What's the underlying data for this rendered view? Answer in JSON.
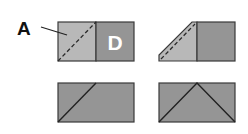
{
  "diagram": {
    "labels": {
      "pointer": "A",
      "panel": "D"
    },
    "colors": {
      "background": "#ffffff",
      "light_fill": "#b8b8b8",
      "dark_fill": "#959595",
      "stroke": "#3a3a3a",
      "panel_text": "#ffffff",
      "label_text": "#111111"
    },
    "steps": [
      {
        "id": 1,
        "description": "Rectangle split into light square A (with dashed diagonal fold) and dark square D"
      },
      {
        "id": 2,
        "description": "Left square folded along dashed diagonal forming a trapezoid"
      },
      {
        "id": 3,
        "description": "Dark rectangle with one diagonal line"
      },
      {
        "id": 4,
        "description": "Dark rectangle with triangular peak lines"
      }
    ]
  }
}
